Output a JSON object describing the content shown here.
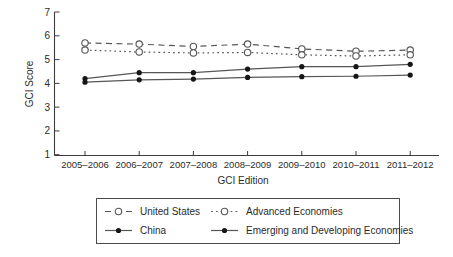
{
  "page": {
    "background": "#ffffff"
  },
  "colors": {
    "axis": "#3c3c3c",
    "line": "#565656",
    "marker_fill": "#161616",
    "marker_open_fill": "#ffffff",
    "text": "#2b2b2b",
    "legend_border": "#4a4a4a"
  },
  "chart_data": {
    "type": "line",
    "title": "",
    "xlabel": "GCI Edition",
    "ylabel": "GCI Score",
    "ylim": [
      1,
      7
    ],
    "yticks": [
      1,
      2,
      3,
      4,
      5,
      6,
      7
    ],
    "grid": false,
    "legend_position": "bottom-box",
    "categories": [
      "2005–2006",
      "2006–2007",
      "2007–2008",
      "2008–2009",
      "2009–2010",
      "2010–2011",
      "2011–2012"
    ],
    "series": [
      {
        "name": "United States",
        "line": "dashed",
        "marker": "open-circle",
        "values": [
          5.7,
          5.65,
          5.55,
          5.65,
          5.45,
          5.35,
          5.4
        ]
      },
      {
        "name": "Advanced Economies",
        "line": "dotted",
        "marker": "open-circle",
        "values": [
          5.4,
          5.32,
          5.28,
          5.3,
          5.2,
          5.15,
          5.2
        ]
      },
      {
        "name": "China",
        "line": "solid",
        "marker": "filled-circle",
        "values": [
          4.2,
          4.45,
          4.45,
          4.6,
          4.7,
          4.7,
          4.8
        ]
      },
      {
        "name": "Emerging and Developing Economies",
        "line": "solid",
        "marker": "filled-circle",
        "values": [
          4.05,
          4.15,
          4.18,
          4.25,
          4.28,
          4.3,
          4.35
        ]
      }
    ]
  }
}
